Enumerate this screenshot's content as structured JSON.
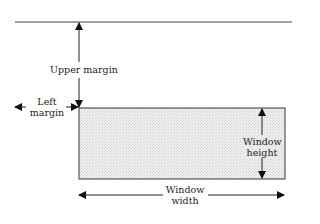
{
  "diagram": {
    "labels": {
      "upper_margin": "Upper margin",
      "left_margin_line1": "Left",
      "left_margin_line2": "margin",
      "window_height_line1": "Window",
      "window_height_line2": "height",
      "window_width_line1": "Window",
      "window_width_line2": "width"
    },
    "colors": {
      "line": "#333333",
      "window_fill": "#e8e8e8",
      "window_border": "#555555"
    },
    "geometry": {
      "screen_top_line": {
        "x1": 15,
        "x2": 292,
        "y": 22
      },
      "window_rect": {
        "x": 79,
        "y": 108,
        "width": 206,
        "height": 71
      },
      "upper_margin_arrow": {
        "x": 79,
        "y1": 22,
        "y2": 108
      },
      "left_margin_arrow": {
        "y": 107,
        "x1": 15,
        "x2": 79
      },
      "height_arrow": {
        "x": 262,
        "y1": 108,
        "y2": 179
      },
      "width_arrow": {
        "y": 195,
        "x1": 78,
        "x2": 285
      }
    }
  }
}
